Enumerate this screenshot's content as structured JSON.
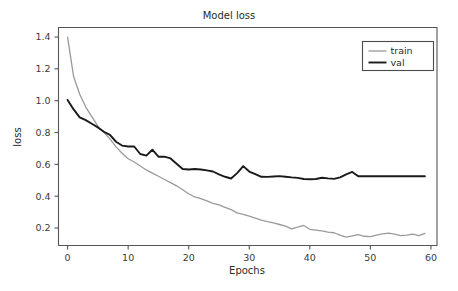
{
  "chart_data": {
    "type": "line",
    "title": "Model loss",
    "xlabel": "Epochs",
    "ylabel": "loss",
    "xlim": [
      -1.5,
      61
    ],
    "ylim": [
      0.09,
      1.46
    ],
    "grid": false,
    "legend_position": "top-right",
    "xticks": [
      0,
      10,
      20,
      30,
      40,
      50,
      60
    ],
    "xtick_labels": [
      "0",
      "10",
      "20",
      "30",
      "40",
      "50",
      "60"
    ],
    "yticks": [
      0.2,
      0.4,
      0.6,
      0.8,
      1.0,
      1.2,
      1.4
    ],
    "ytick_labels": [
      "0.2",
      "0.4",
      "0.6",
      "0.8",
      "1.0",
      "1.2",
      "1.4"
    ],
    "x": [
      0,
      1,
      2,
      3,
      4,
      5,
      6,
      7,
      8,
      9,
      10,
      11,
      12,
      13,
      14,
      15,
      16,
      17,
      18,
      19,
      20,
      21,
      22,
      23,
      24,
      25,
      26,
      27,
      28,
      29,
      30,
      31,
      32,
      33,
      34,
      35,
      36,
      37,
      38,
      39,
      40,
      41,
      42,
      43,
      44,
      45,
      46,
      47,
      48,
      49,
      50,
      51,
      52,
      53,
      54,
      55,
      56,
      57,
      58,
      59
    ],
    "series": [
      {
        "name": "train",
        "color": "#9a9a9a",
        "width": 1.3,
        "values": [
          1.4,
          1.15,
          1.04,
          0.96,
          0.9,
          0.84,
          0.8,
          0.76,
          0.71,
          0.67,
          0.635,
          0.615,
          0.59,
          0.565,
          0.545,
          0.525,
          0.505,
          0.485,
          0.465,
          0.44,
          0.415,
          0.395,
          0.385,
          0.37,
          0.355,
          0.345,
          0.33,
          0.315,
          0.295,
          0.285,
          0.275,
          0.262,
          0.25,
          0.24,
          0.232,
          0.222,
          0.212,
          0.195,
          0.205,
          0.216,
          0.192,
          0.187,
          0.182,
          0.174,
          0.17,
          0.155,
          0.143,
          0.15,
          0.158,
          0.148,
          0.146,
          0.155,
          0.163,
          0.168,
          0.162,
          0.152,
          0.155,
          0.162,
          0.152,
          0.166
        ]
      },
      {
        "name": "val",
        "color": "#1a1a1a",
        "width": 1.9,
        "values": [
          1.005,
          0.945,
          0.895,
          0.878,
          0.855,
          0.832,
          0.805,
          0.785,
          0.742,
          0.718,
          0.712,
          0.712,
          0.665,
          0.655,
          0.692,
          0.648,
          0.648,
          0.637,
          0.604,
          0.571,
          0.568,
          0.571,
          0.568,
          0.562,
          0.555,
          0.537,
          0.522,
          0.511,
          0.545,
          0.589,
          0.555,
          0.538,
          0.522,
          0.521,
          0.524,
          0.526,
          0.522,
          0.518,
          0.515,
          0.508,
          0.506,
          0.508,
          0.516,
          0.512,
          0.509,
          0.518,
          0.537,
          0.552,
          0.525,
          0.525,
          0.525,
          0.525,
          0.525,
          0.525,
          0.525,
          0.525,
          0.525,
          0.525,
          0.525,
          0.525
        ]
      }
    ],
    "legend_entries": [
      {
        "label": "train",
        "color": "#9a9a9a",
        "width": 1.3
      },
      {
        "label": "val",
        "color": "#1a1a1a",
        "width": 1.9
      }
    ]
  }
}
